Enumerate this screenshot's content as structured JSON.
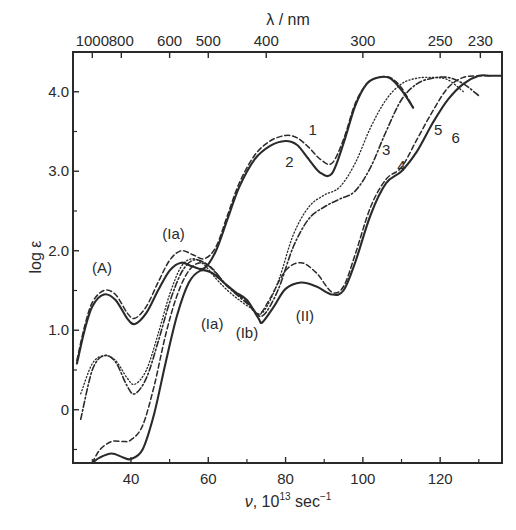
{
  "chart_data": {
    "type": "line",
    "title": "",
    "xlabel": "ν, 10^13 sec^-1",
    "xlabel_parts": {
      "symbol": "ν",
      "prefix": ", 10",
      "exp": "13",
      "unit": " sec",
      "unit_exp": "−1"
    },
    "ylabel": "log ε",
    "top_axis_label": "λ / nm",
    "xlim": [
      25,
      136
    ],
    "ylim": [
      -0.67,
      4.5
    ],
    "x_ticks": [
      40,
      60,
      80,
      100,
      120
    ],
    "x_minor_ticks": [
      30,
      50,
      70,
      90,
      110,
      130
    ],
    "y_ticks": [
      {
        "value": 4.0,
        "label": "4.0"
      },
      {
        "value": 3.0,
        "label": "3.0"
      },
      {
        "value": 2.0,
        "label": "2.0"
      },
      {
        "value": 1.0,
        "label": "1.0"
      },
      {
        "value": 0,
        "label": "0"
      }
    ],
    "y_minor_ticks": [
      3.5,
      2.5,
      1.5,
      0.5,
      -0.5
    ],
    "top_ticks": [
      {
        "label": "1000",
        "nu": 30.0
      },
      {
        "label": "800",
        "nu": 37.5
      },
      {
        "label": "600",
        "nu": 50.0
      },
      {
        "label": "500",
        "nu": 60.0
      },
      {
        "label": "400",
        "nu": 75.0
      },
      {
        "label": "300",
        "nu": 100.0
      },
      {
        "label": "250",
        "nu": 120.0
      },
      {
        "label": "230",
        "nu": 130.4
      }
    ],
    "grid": false,
    "legend": "none (curves numbered inline 1–6)",
    "series": [
      {
        "name": "1",
        "style": "dashed",
        "x": [
          26,
          28,
          30,
          33,
          36,
          39,
          41,
          44,
          47,
          50,
          53,
          56,
          59,
          62,
          65,
          68,
          72,
          76,
          80,
          83,
          86,
          89,
          92,
          95,
          98,
          101,
          104,
          107,
          110,
          113
        ],
        "y": [
          0.62,
          1.05,
          1.35,
          1.5,
          1.45,
          1.22,
          1.15,
          1.3,
          1.6,
          1.88,
          2.0,
          1.95,
          1.9,
          2.05,
          2.45,
          2.85,
          3.2,
          3.38,
          3.45,
          3.42,
          3.3,
          3.15,
          3.1,
          3.4,
          3.85,
          4.1,
          4.18,
          4.18,
          4.05,
          3.8
        ]
      },
      {
        "name": "2",
        "style": "solid",
        "x": [
          26,
          28,
          30,
          33,
          36,
          39,
          41,
          44,
          47,
          50,
          53,
          56,
          59,
          62,
          65,
          68,
          72,
          76,
          80,
          83,
          86,
          89,
          92,
          95,
          98,
          101,
          104,
          107,
          110,
          113
        ],
        "y": [
          0.58,
          1.0,
          1.3,
          1.45,
          1.38,
          1.15,
          1.08,
          1.22,
          1.5,
          1.75,
          1.85,
          1.8,
          1.78,
          2.0,
          2.4,
          2.8,
          3.15,
          3.32,
          3.38,
          3.33,
          3.15,
          2.98,
          2.97,
          3.35,
          3.82,
          4.1,
          4.18,
          4.17,
          4.02,
          3.8
        ]
      },
      {
        "name": "3",
        "style": "dotted",
        "x": [
          27,
          30,
          33,
          36,
          39,
          41,
          44,
          47,
          50,
          53,
          56,
          59,
          62,
          65,
          68,
          71,
          74,
          78,
          82,
          86,
          90,
          94,
          98,
          102,
          106,
          110,
          114,
          118,
          122,
          126
        ],
        "y": [
          0.2,
          0.58,
          0.68,
          0.62,
          0.4,
          0.32,
          0.5,
          0.95,
          1.45,
          1.8,
          1.9,
          1.82,
          1.65,
          1.5,
          1.38,
          1.28,
          1.22,
          1.6,
          2.2,
          2.55,
          2.7,
          2.8,
          3.1,
          3.55,
          3.9,
          4.1,
          4.17,
          4.18,
          4.15,
          4.0
        ]
      },
      {
        "name": "4",
        "style": "dash-dot",
        "x": [
          27,
          30,
          33,
          36,
          39,
          41,
          44,
          47,
          50,
          53,
          56,
          59,
          62,
          65,
          68,
          71,
          74,
          78,
          82,
          86,
          90,
          94,
          98,
          102,
          106,
          110,
          114,
          118,
          122,
          126,
          130
        ],
        "y": [
          -0.12,
          0.5,
          0.68,
          0.6,
          0.3,
          0.2,
          0.4,
          0.85,
          1.35,
          1.72,
          1.88,
          1.85,
          1.72,
          1.55,
          1.42,
          1.3,
          1.18,
          1.5,
          2.05,
          2.4,
          2.55,
          2.65,
          2.75,
          3.05,
          3.5,
          3.9,
          4.1,
          4.17,
          4.18,
          4.1,
          3.95
        ]
      },
      {
        "name": "5",
        "style": "dashed",
        "x": [
          30,
          32,
          35,
          38,
          40,
          43,
          46,
          49,
          52,
          55,
          58,
          61,
          64,
          67,
          70,
          73,
          76,
          80,
          84,
          88,
          92,
          95,
          98,
          102,
          106,
          110,
          114,
          118,
          122,
          126,
          130,
          133
        ],
        "y": [
          -0.67,
          -0.5,
          -0.4,
          -0.4,
          -0.38,
          -0.2,
          0.3,
          0.95,
          1.45,
          1.75,
          1.85,
          1.78,
          1.6,
          1.48,
          1.35,
          1.2,
          1.4,
          1.75,
          1.85,
          1.72,
          1.48,
          1.55,
          1.95,
          2.55,
          2.9,
          3.05,
          3.4,
          3.75,
          4.05,
          4.18,
          4.2,
          4.2
        ]
      },
      {
        "name": "6",
        "style": "solid",
        "x": [
          30,
          32,
          35,
          38,
          40,
          43,
          46,
          49,
          52,
          55,
          58,
          61,
          64,
          67,
          70,
          73,
          74,
          77,
          80,
          84,
          88,
          92,
          95,
          98,
          102,
          106,
          110,
          114,
          118,
          122,
          126,
          130,
          133,
          136
        ],
        "y": [
          -0.67,
          -0.6,
          -0.55,
          -0.6,
          -0.62,
          -0.5,
          -0.05,
          0.6,
          1.2,
          1.6,
          1.75,
          1.72,
          1.6,
          1.48,
          1.38,
          1.15,
          1.1,
          1.3,
          1.52,
          1.6,
          1.55,
          1.45,
          1.5,
          1.85,
          2.45,
          2.85,
          3.0,
          3.25,
          3.6,
          3.9,
          4.1,
          4.2,
          4.2,
          4.2
        ]
      }
    ],
    "annotations": [
      {
        "text": "(A)",
        "x": 32.5,
        "y": 1.72
      },
      {
        "text": "(Ia)",
        "x": 51,
        "y": 2.15
      },
      {
        "text": "(Ia)",
        "x": 61,
        "y": 1.02
      },
      {
        "text": "(Ib)",
        "x": 70,
        "y": 0.9
      },
      {
        "text": "(II)",
        "x": 85,
        "y": 1.12
      },
      {
        "text": "1",
        "x": 87,
        "y": 3.45
      },
      {
        "text": "2",
        "x": 81,
        "y": 3.05
      },
      {
        "text": "3",
        "x": 106,
        "y": 3.2
      },
      {
        "text": "4",
        "x": 110,
        "y": 3.0
      },
      {
        "text": "5",
        "x": 119.5,
        "y": 3.45
      },
      {
        "text": "6",
        "x": 124,
        "y": 3.35
      }
    ]
  },
  "styles": {
    "ink": "#2a2a2a",
    "background": "#ffffff"
  }
}
